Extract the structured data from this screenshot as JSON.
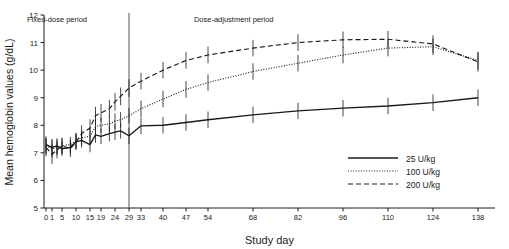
{
  "chart_data": {
    "type": "line",
    "title": "",
    "xlabel": "Study day",
    "ylabel": "Mean hemoglobin values (g/dL)",
    "ylim": [
      5,
      12
    ],
    "yticks": [
      5,
      6,
      7,
      8,
      9,
      10,
      11,
      12
    ],
    "xticks": [
      0,
      1,
      5,
      10,
      15,
      19,
      24,
      29,
      33,
      40,
      47,
      54,
      68,
      82,
      96,
      110,
      124,
      138
    ],
    "xtick_labels": [
      "0",
      "1",
      "5",
      "10",
      "15",
      "19",
      "24",
      "29",
      "33",
      "40",
      "47",
      "54",
      "68",
      "82",
      "96",
      "110",
      "124",
      "138"
    ],
    "grid": false,
    "legend_position": "lower-right",
    "annotations": [
      {
        "name": "fixed-dose-period",
        "text": "Fixed-dose period",
        "x_day": 3,
        "y_value": 11.75
      },
      {
        "name": "dose-adjustment-period",
        "text": "Dose-adjustment period",
        "x_day": 62,
        "y_value": 11.75
      },
      {
        "name": "period-divider",
        "text": "",
        "x_day": 29,
        "type": "vline"
      }
    ],
    "x": [
      0,
      1,
      3,
      5,
      8,
      10,
      12,
      15,
      17,
      19,
      22,
      24,
      26,
      29,
      33,
      40,
      47,
      54,
      68,
      82,
      96,
      110,
      124,
      138
    ],
    "series": [
      {
        "name": "25 U/kg",
        "style": "solid",
        "values": [
          7.3,
          7.2,
          7.25,
          7.15,
          7.2,
          7.4,
          7.45,
          7.3,
          7.65,
          7.6,
          7.7,
          7.75,
          7.8,
          7.62,
          7.98,
          8.0,
          8.1,
          8.2,
          8.38,
          8.52,
          8.62,
          8.7,
          8.82,
          9.0
        ],
        "errors": [
          0.3,
          0.3,
          0.28,
          0.26,
          0.26,
          0.26,
          0.26,
          0.28,
          0.28,
          0.28,
          0.28,
          0.28,
          0.28,
          0.3,
          0.3,
          0.3,
          0.3,
          0.3,
          0.3,
          0.3,
          0.3,
          0.3,
          0.3,
          0.3
        ]
      },
      {
        "name": "100 U/kg",
        "style": "dotted",
        "values": [
          7.25,
          7.15,
          7.2,
          7.25,
          7.3,
          7.45,
          7.55,
          7.6,
          7.95,
          8.0,
          8.05,
          8.15,
          8.2,
          8.35,
          8.6,
          8.95,
          9.3,
          9.55,
          9.95,
          10.25,
          10.55,
          10.8,
          10.85,
          10.35
        ],
        "errors": [
          0.3,
          0.32,
          0.28,
          0.28,
          0.28,
          0.28,
          0.28,
          0.28,
          0.28,
          0.28,
          0.28,
          0.28,
          0.28,
          0.28,
          0.3,
          0.3,
          0.3,
          0.3,
          0.3,
          0.3,
          0.3,
          0.3,
          0.3,
          0.32
        ]
      },
      {
        "name": "200 U/kg",
        "style": "dashed",
        "values": [
          7.2,
          6.95,
          7.1,
          7.25,
          7.15,
          7.4,
          7.7,
          7.9,
          8.35,
          8.45,
          8.6,
          8.85,
          9.05,
          9.35,
          9.6,
          10.0,
          10.35,
          10.55,
          10.8,
          11.0,
          11.1,
          11.12,
          10.95,
          10.3
        ],
        "errors": [
          0.32,
          0.35,
          0.3,
          0.3,
          0.3,
          0.3,
          0.3,
          0.32,
          0.32,
          0.32,
          0.32,
          0.32,
          0.32,
          0.32,
          0.3,
          0.3,
          0.3,
          0.3,
          0.3,
          0.3,
          0.3,
          0.3,
          0.32,
          0.35
        ]
      }
    ]
  },
  "legend": {
    "items": [
      {
        "label": "25 U/kg",
        "style": "solid"
      },
      {
        "label": "100 U/kg",
        "style": "dotted"
      },
      {
        "label": "200 U/kg",
        "style": "dashed"
      }
    ]
  },
  "colors": {
    "ink": "#1a1a1a",
    "axis": "#222222",
    "background": "#ffffff"
  }
}
